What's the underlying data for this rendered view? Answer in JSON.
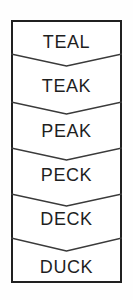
{
  "diagram": {
    "type": "word-ladder",
    "title": "",
    "orientation": "vertical",
    "outline_color": "#202020",
    "divider_color": "#3a3a3a",
    "text_color": "#1f1f1f",
    "background_color": "#ffffff",
    "box": {
      "x": 11,
      "y": 20,
      "width": 111,
      "height": 263
    },
    "rows": [
      {
        "index": 0,
        "word": "TEAL",
        "text_center_y": 42
      },
      {
        "index": 1,
        "word": "TEAK",
        "text_center_y": 86
      },
      {
        "index": 2,
        "word": "PEAK",
        "text_center_y": 131
      },
      {
        "index": 3,
        "word": "PECK",
        "text_center_y": 175
      },
      {
        "index": 4,
        "word": "DECK",
        "text_center_y": 219
      },
      {
        "index": 5,
        "word": "DUCK",
        "text_center_y": 267
      }
    ],
    "dividers": [
      {
        "index": 0,
        "edge_y": 54,
        "tip_y": 66
      },
      {
        "index": 1,
        "edge_y": 102,
        "tip_y": 114
      },
      {
        "index": 2,
        "edge_y": 148,
        "tip_y": 160
      },
      {
        "index": 3,
        "edge_y": 194,
        "tip_y": 206
      },
      {
        "index": 4,
        "edge_y": 238,
        "tip_y": 251
      }
    ]
  }
}
